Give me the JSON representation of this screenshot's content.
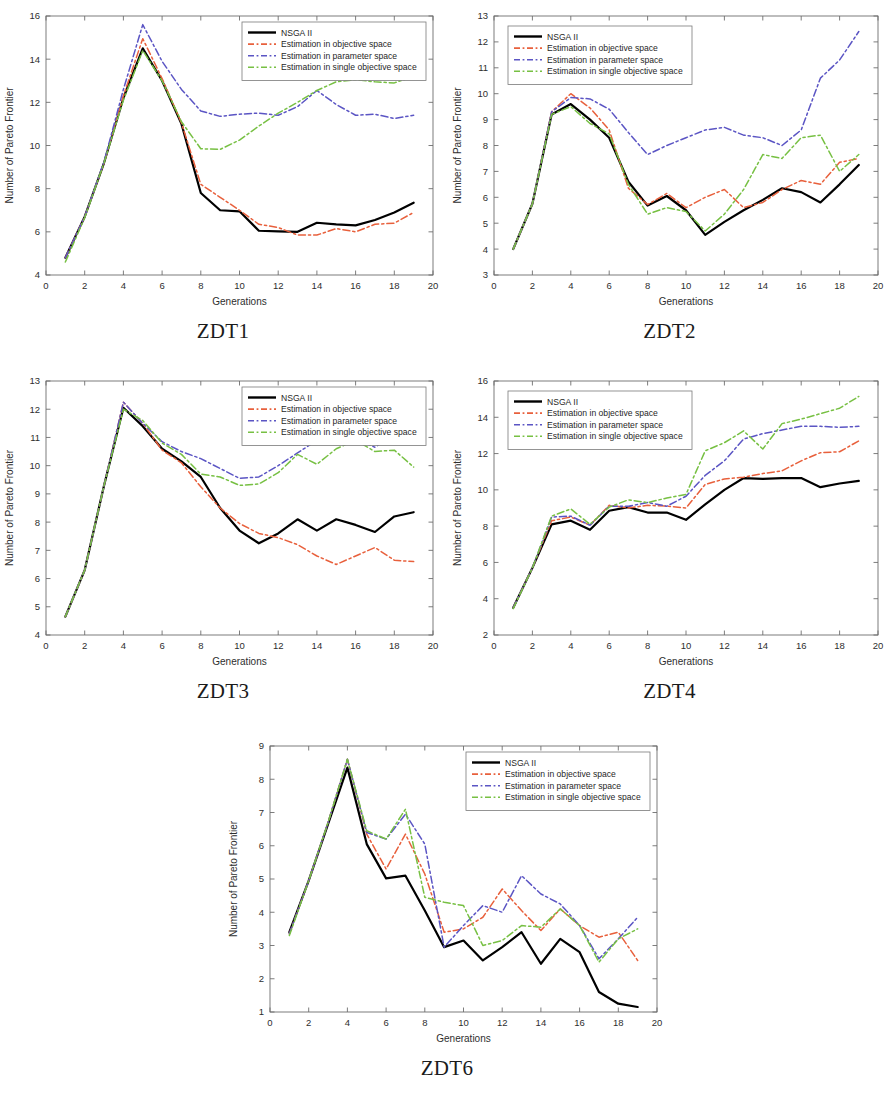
{
  "figure": {
    "axis_xlabel": "Generations",
    "axis_ylabel": "Number of Pareto Frontier",
    "legend": [
      {
        "label": "NSGA II",
        "color": "#000000",
        "dash": "solid"
      },
      {
        "label": "Estimation in objective space",
        "color": "#e8603c",
        "dash": "dashdot"
      },
      {
        "label": "Estimation in parameter space",
        "color": "#5b55c4",
        "dash": "dashdot"
      },
      {
        "label": "Estimation in single objective space",
        "color": "#77c043",
        "dash": "dashdot"
      }
    ],
    "captions": {
      "zdt1": "ZDT1",
      "zdt2": "ZDT2",
      "zdt3": "ZDT3",
      "zdt4": "ZDT4",
      "zdt6": "ZDT6"
    }
  },
  "chart_data": [
    {
      "id": "zdt1",
      "type": "line",
      "title": "ZDT1",
      "xlabel": "Generations",
      "ylabel": "Number of Pareto Frontier",
      "xlim": [
        0,
        20
      ],
      "ylim": [
        4,
        16
      ],
      "xticks": [
        0,
        2,
        4,
        6,
        8,
        10,
        12,
        14,
        16,
        18,
        20
      ],
      "yticks": [
        4,
        6,
        8,
        10,
        12,
        14,
        16
      ],
      "grid": false,
      "legend_position": "top-right",
      "x": [
        1,
        2,
        3,
        4,
        5,
        6,
        7,
        8,
        9,
        10,
        11,
        12,
        13,
        14,
        15,
        16,
        17,
        18,
        19
      ],
      "series": [
        {
          "name": "NSGA II",
          "color": "#000000",
          "dash": "solid",
          "values": [
            4.8,
            6.7,
            9.2,
            12.2,
            14.5,
            13.0,
            11.0,
            7.8,
            7.0,
            6.95,
            6.05,
            6.02,
            6.0,
            6.42,
            6.35,
            6.3,
            6.55,
            6.9,
            7.35
          ]
        },
        {
          "name": "Estimation in objective space",
          "color": "#e8603c",
          "dash": "dashdot",
          "values": [
            4.8,
            6.7,
            9.2,
            12.3,
            14.95,
            13.1,
            11.05,
            8.2,
            7.6,
            7.0,
            6.35,
            6.2,
            5.85,
            5.85,
            6.15,
            6.0,
            6.35,
            6.4,
            6.9
          ]
        },
        {
          "name": "Estimation in parameter space",
          "color": "#5b55c4",
          "dash": "dashdot",
          "values": [
            4.8,
            6.7,
            9.25,
            12.6,
            15.6,
            13.9,
            12.6,
            11.6,
            11.35,
            11.45,
            11.5,
            11.4,
            11.8,
            12.55,
            11.9,
            11.4,
            11.45,
            11.25,
            11.4
          ]
        },
        {
          "name": "Estimation in single objective space",
          "color": "#77c043",
          "dash": "dashdot",
          "values": [
            4.6,
            6.65,
            9.2,
            12.1,
            14.4,
            13.0,
            11.1,
            9.85,
            9.82,
            10.25,
            10.9,
            11.5,
            12.0,
            12.55,
            12.95,
            13.05,
            12.95,
            12.9,
            13.2
          ]
        }
      ]
    },
    {
      "id": "zdt2",
      "type": "line",
      "title": "ZDT2",
      "xlabel": "Generations",
      "ylabel": "Number of Pareto Frontier",
      "xlim": [
        0,
        20
      ],
      "ylim": [
        3,
        13
      ],
      "xticks": [
        0,
        2,
        4,
        6,
        8,
        10,
        12,
        14,
        16,
        18,
        20
      ],
      "yticks": [
        3,
        4,
        5,
        6,
        7,
        8,
        9,
        10,
        11,
        12,
        13
      ],
      "grid": false,
      "legend_position": "top-left",
      "x": [
        1,
        2,
        3,
        4,
        5,
        6,
        7,
        8,
        9,
        10,
        11,
        12,
        13,
        14,
        15,
        16,
        17,
        18,
        19
      ],
      "series": [
        {
          "name": "NSGA II",
          "color": "#000000",
          "dash": "solid",
          "values": [
            4.0,
            5.75,
            9.2,
            9.6,
            9.0,
            8.3,
            6.6,
            5.68,
            6.05,
            5.5,
            4.55,
            5.05,
            5.5,
            5.9,
            6.35,
            6.2,
            5.8,
            6.5,
            7.25
          ]
        },
        {
          "name": "Estimation in objective space",
          "color": "#e8603c",
          "dash": "dashdot",
          "values": [
            4.0,
            5.75,
            9.3,
            10.0,
            9.45,
            8.6,
            6.35,
            5.72,
            6.15,
            5.6,
            6.0,
            6.3,
            5.6,
            5.8,
            6.3,
            6.65,
            6.5,
            7.35,
            7.5
          ]
        },
        {
          "name": "Estimation in parameter space",
          "color": "#5b55c4",
          "dash": "dashdot",
          "values": [
            4.0,
            5.75,
            9.3,
            9.85,
            9.8,
            9.4,
            8.5,
            7.65,
            8.0,
            8.3,
            8.6,
            8.7,
            8.4,
            8.3,
            8.0,
            8.6,
            10.6,
            11.3,
            12.4
          ]
        },
        {
          "name": "Estimation in single objective space",
          "color": "#77c043",
          "dash": "dashdot",
          "values": [
            4.0,
            5.75,
            9.2,
            9.5,
            8.85,
            8.45,
            6.5,
            5.35,
            5.6,
            5.45,
            4.7,
            5.35,
            6.3,
            7.65,
            7.5,
            8.3,
            8.4,
            7.0,
            7.65
          ]
        }
      ]
    },
    {
      "id": "zdt3",
      "type": "line",
      "title": "ZDT3",
      "xlabel": "Generations",
      "ylabel": "Number of Pareto Frontier",
      "xlim": [
        0,
        20
      ],
      "ylim": [
        4,
        13
      ],
      "xticks": [
        0,
        2,
        4,
        6,
        8,
        10,
        12,
        14,
        16,
        18,
        20
      ],
      "yticks": [
        4,
        5,
        6,
        7,
        8,
        9,
        10,
        11,
        12,
        13
      ],
      "grid": false,
      "legend_position": "top-right",
      "x": [
        1,
        2,
        3,
        4,
        5,
        6,
        7,
        8,
        9,
        10,
        11,
        12,
        13,
        14,
        15,
        16,
        17,
        18,
        19
      ],
      "series": [
        {
          "name": "NSGA II",
          "color": "#000000",
          "dash": "solid",
          "values": [
            4.65,
            6.3,
            9.3,
            12.05,
            11.4,
            10.6,
            10.15,
            9.6,
            8.5,
            7.7,
            7.25,
            7.6,
            8.1,
            7.7,
            8.1,
            7.9,
            7.65,
            8.2,
            8.35
          ]
        },
        {
          "name": "Estimation in objective space",
          "color": "#e8603c",
          "dash": "dashdot",
          "values": [
            4.65,
            6.3,
            9.3,
            12.25,
            11.5,
            10.55,
            10.1,
            9.25,
            8.5,
            7.95,
            7.6,
            7.45,
            7.2,
            6.8,
            6.5,
            6.8,
            7.1,
            6.65,
            6.6
          ]
        },
        {
          "name": "Estimation in parameter space",
          "color": "#5b55c4",
          "dash": "dashdot",
          "values": [
            4.65,
            6.3,
            9.3,
            12.25,
            11.5,
            10.85,
            10.5,
            10.25,
            9.9,
            9.55,
            9.6,
            10.0,
            10.45,
            10.9,
            11.15,
            10.95,
            10.65,
            11.1,
            11.85
          ]
        },
        {
          "name": "Estimation in single objective space",
          "color": "#77c043",
          "dash": "dashdot",
          "values": [
            4.65,
            6.3,
            9.3,
            12.0,
            11.6,
            10.8,
            10.4,
            9.7,
            9.6,
            9.3,
            9.35,
            9.75,
            10.4,
            10.05,
            10.6,
            10.9,
            10.5,
            10.55,
            9.95
          ]
        }
      ]
    },
    {
      "id": "zdt4",
      "type": "line",
      "title": "ZDT4",
      "xlabel": "Generations",
      "ylabel": "Number of Pareto Frontier",
      "xlim": [
        0,
        20
      ],
      "ylim": [
        2,
        16
      ],
      "xticks": [
        0,
        2,
        4,
        6,
        8,
        10,
        12,
        14,
        16,
        18,
        20
      ],
      "yticks": [
        2,
        4,
        6,
        8,
        10,
        12,
        14,
        16
      ],
      "grid": false,
      "legend_position": "top-left",
      "x": [
        1,
        2,
        3,
        4,
        5,
        6,
        7,
        8,
        9,
        10,
        11,
        12,
        13,
        14,
        15,
        16,
        17,
        18,
        19
      ],
      "series": [
        {
          "name": "NSGA II",
          "color": "#000000",
          "dash": "solid",
          "values": [
            3.5,
            5.7,
            8.1,
            8.3,
            7.8,
            8.85,
            9.05,
            8.75,
            8.75,
            8.35,
            9.2,
            10.0,
            10.65,
            10.6,
            10.65,
            10.65,
            10.15,
            10.35,
            10.5
          ]
        },
        {
          "name": "Estimation in objective space",
          "color": "#e8603c",
          "dash": "dashdot",
          "values": [
            3.5,
            5.7,
            8.3,
            8.5,
            8.05,
            9.15,
            9.0,
            9.15,
            9.1,
            9.0,
            10.3,
            10.6,
            10.7,
            10.9,
            11.05,
            11.6,
            12.05,
            12.1,
            12.7
          ]
        },
        {
          "name": "Estimation in parameter space",
          "color": "#5b55c4",
          "dash": "dashdot",
          "values": [
            3.5,
            5.7,
            8.5,
            8.55,
            8.05,
            9.1,
            9.1,
            9.3,
            9.1,
            9.65,
            10.8,
            11.6,
            12.8,
            13.1,
            13.3,
            13.5,
            13.5,
            13.45,
            13.5
          ]
        },
        {
          "name": "Estimation in single objective space",
          "color": "#77c043",
          "dash": "dashdot",
          "values": [
            3.45,
            5.7,
            8.55,
            8.95,
            8.1,
            9.05,
            9.45,
            9.3,
            9.55,
            9.75,
            12.15,
            12.6,
            13.25,
            12.25,
            13.65,
            13.9,
            14.2,
            14.5,
            15.15
          ]
        }
      ]
    },
    {
      "id": "zdt6",
      "type": "line",
      "title": "ZDT6",
      "xlabel": "Generations",
      "ylabel": "Number of Pareto Frontier",
      "xlim": [
        0,
        20
      ],
      "ylim": [
        1,
        9
      ],
      "xticks": [
        0,
        2,
        4,
        6,
        8,
        10,
        12,
        14,
        16,
        18,
        20
      ],
      "yticks": [
        1,
        2,
        3,
        4,
        5,
        6,
        7,
        8,
        9
      ],
      "grid": false,
      "legend_position": "top-right",
      "x": [
        1,
        2,
        3,
        4,
        5,
        6,
        7,
        8,
        9,
        10,
        11,
        12,
        13,
        14,
        15,
        16,
        17,
        18,
        19
      ],
      "series": [
        {
          "name": "NSGA II",
          "color": "#000000",
          "dash": "solid",
          "values": [
            3.4,
            4.95,
            6.65,
            8.35,
            6.05,
            5.02,
            5.1,
            4.05,
            2.95,
            3.15,
            2.55,
            2.95,
            3.4,
            2.45,
            3.2,
            2.8,
            1.6,
            1.25,
            1.15
          ]
        },
        {
          "name": "Estimation in objective space",
          "color": "#e8603c",
          "dash": "dashdot",
          "values": [
            3.35,
            4.95,
            6.7,
            8.6,
            6.35,
            5.3,
            6.35,
            5.15,
            3.4,
            3.5,
            3.85,
            4.7,
            4.05,
            3.45,
            4.1,
            3.6,
            3.25,
            3.4,
            2.55
          ]
        },
        {
          "name": "Estimation in parameter space",
          "color": "#5b55c4",
          "dash": "dashdot",
          "values": [
            3.35,
            4.95,
            6.7,
            8.6,
            6.4,
            6.2,
            6.95,
            6.05,
            2.95,
            3.6,
            4.2,
            4.0,
            5.1,
            4.55,
            4.25,
            3.6,
            2.6,
            3.2,
            3.85
          ]
        },
        {
          "name": "Estimation in single objective space",
          "color": "#77c043",
          "dash": "dashdot",
          "values": [
            3.3,
            4.95,
            6.7,
            8.6,
            6.45,
            6.2,
            7.1,
            4.45,
            4.3,
            4.2,
            3.0,
            3.15,
            3.6,
            3.55,
            4.1,
            3.6,
            2.5,
            3.2,
            3.5
          ]
        }
      ]
    }
  ]
}
